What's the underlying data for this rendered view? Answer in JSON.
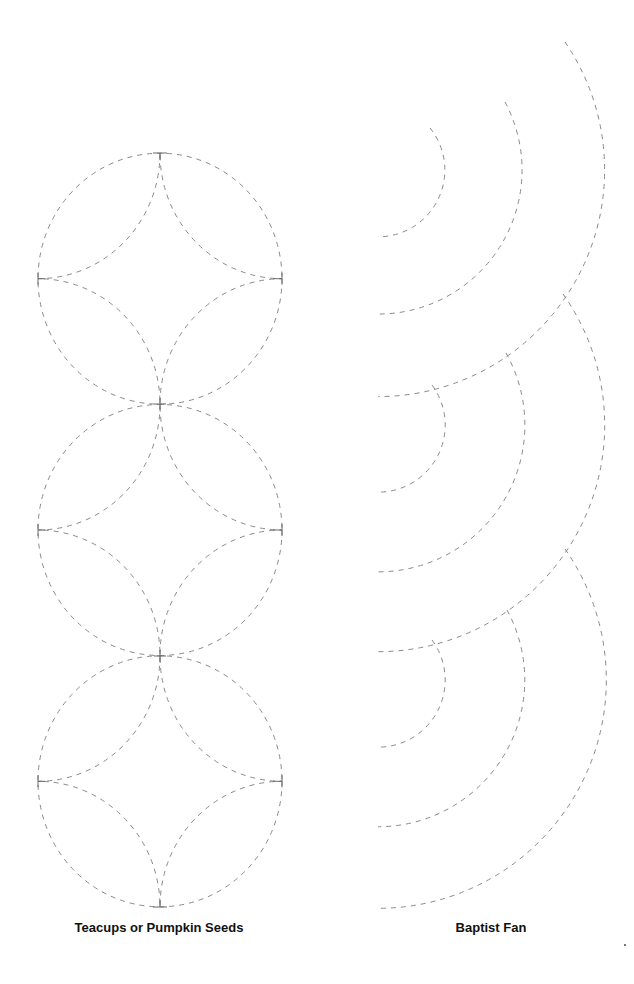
{
  "page": {
    "background": "#ffffff",
    "line_color": "#8a8a8a",
    "tick_color": "#6a6a6a",
    "dash": "5 5"
  },
  "patterns": {
    "teacups": {
      "caption": "Teacups or Pumpkin Seeds",
      "caption_x": 159,
      "caption_y": 920,
      "circle_cx": 160,
      "circle_rx": 122,
      "circle_ry": 125.5,
      "circle_centers_y": [
        278.7,
        530,
        781.3
      ],
      "ticks": {
        "top": {
          "x": 160,
          "y": 153
        },
        "crosses": [
          {
            "x": 160,
            "y": 404
          },
          {
            "x": 160,
            "y": 656
          }
        ],
        "bottom": {
          "x": 160,
          "y": 907
        },
        "left_x": 38,
        "right_x": 282
      }
    },
    "baptist_fan": {
      "caption": "Baptist Fan",
      "caption_x": 491,
      "caption_y": 920,
      "center_x": 378,
      "fans": [
        {
          "center_y": 170,
          "arcs": [
            {
              "r": 64,
              "start": [
                430,
                128
              ]
            },
            {
              "r": 144,
              "start": [
                505,
                102
              ]
            },
            {
              "r": 222,
              "start": [
                565,
                42
              ]
            }
          ]
        },
        {
          "center_y": 425,
          "arcs": [
            {
              "r": 64,
              "start": [
                432,
                385
              ]
            },
            {
              "r": 144,
              "start": [
                506,
                353
              ]
            },
            {
              "r": 222,
              "start": [
                563,
                294
              ]
            }
          ]
        },
        {
          "center_y": 680,
          "arcs": [
            {
              "r": 64,
              "start": [
                432,
                640
              ]
            },
            {
              "r": 144,
              "start": [
                507,
                610
              ]
            },
            {
              "r": 222,
              "start": [
                565,
                549
              ]
            }
          ]
        }
      ]
    }
  },
  "speck": {
    "x": 624,
    "y": 944
  }
}
